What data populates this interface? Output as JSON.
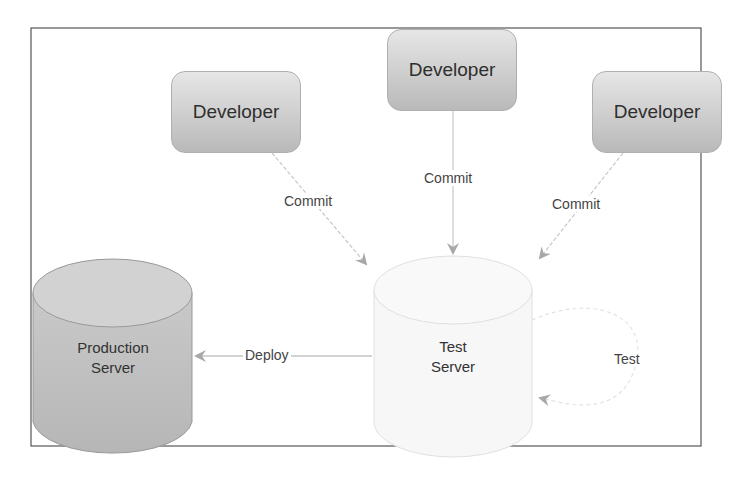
{
  "developers": [
    {
      "label": "Developer"
    },
    {
      "label": "Developer"
    },
    {
      "label": "Developer"
    }
  ],
  "edges": {
    "commit_left": "Commit",
    "commit_center": "Commit",
    "commit_right": "Commit",
    "deploy": "Deploy",
    "test": "Test"
  },
  "servers": {
    "production": {
      "line1": "Production",
      "line2": "Server"
    },
    "test": {
      "line1": "Test",
      "line2": "Server"
    }
  },
  "colors": {
    "developer_top": "#e6e6e6",
    "developer_bottom": "#b9b9b9",
    "production_fill": "#c4c4c4",
    "test_fill": "#f7f7f7",
    "arrow": "#b5b5b5",
    "frame": "#555555"
  }
}
